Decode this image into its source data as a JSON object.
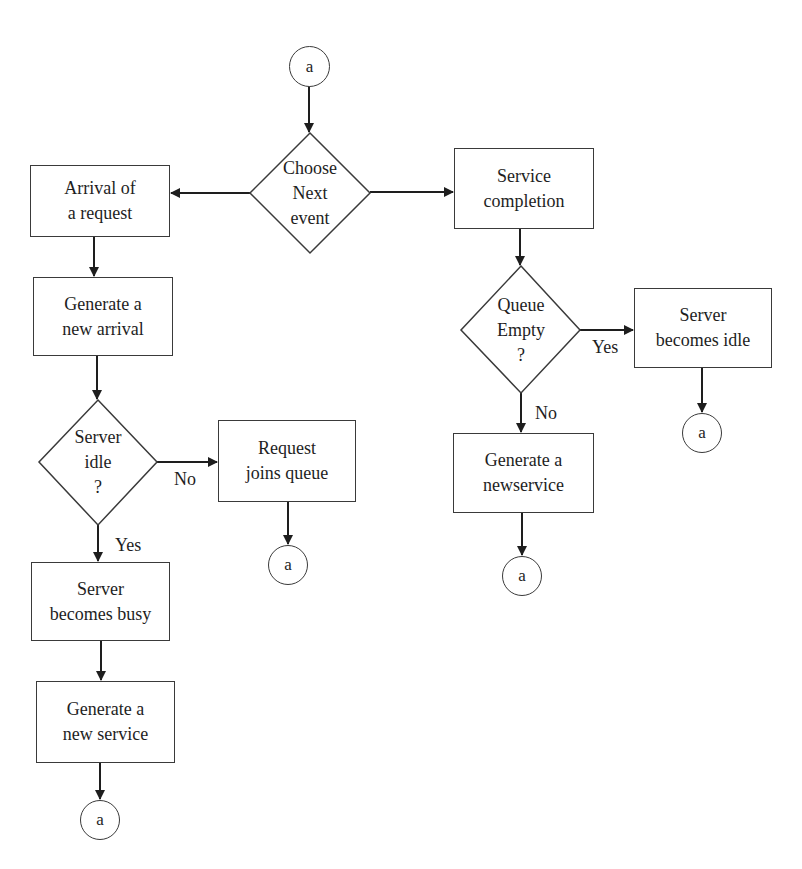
{
  "diagram": {
    "type": "flowchart",
    "colors": {
      "stroke": "#3a3a3a",
      "text": "#1e1e1e",
      "background": "#ffffff"
    },
    "connector_label": "a",
    "nodes": {
      "start": {
        "label": "a",
        "shape": "connector"
      },
      "choose_next_event": {
        "label": "Choose\nNext\nevent",
        "shape": "diamond"
      },
      "arrival_of_request": {
        "label": "Arrival of\na request",
        "shape": "box"
      },
      "generate_new_arrival": {
        "label": "Generate a\nnew arrival",
        "shape": "box"
      },
      "server_idle": {
        "label": "Server\nidle\n?",
        "shape": "diamond"
      },
      "request_joins_queue": {
        "label": "Request\njoins queue",
        "shape": "box"
      },
      "rjq_end": {
        "label": "a",
        "shape": "connector"
      },
      "server_becomes_busy": {
        "label": "Server\nbecomes busy",
        "shape": "box"
      },
      "generate_new_service_left": {
        "label": "Generate a\nnew service",
        "shape": "box"
      },
      "left_end": {
        "label": "a",
        "shape": "connector"
      },
      "service_completion": {
        "label": "Service\ncompletion",
        "shape": "box"
      },
      "queue_empty": {
        "label": "Queue\nEmpty\n?",
        "shape": "diamond"
      },
      "server_becomes_idle": {
        "label": "Server\nbecomes idle",
        "shape": "box"
      },
      "sbi_end": {
        "label": "a",
        "shape": "connector"
      },
      "generate_newservice_right": {
        "label": "Generate a\nnewservice",
        "shape": "box"
      },
      "right_end": {
        "label": "a",
        "shape": "connector"
      }
    },
    "edge_labels": {
      "server_idle_no": "No",
      "server_idle_yes": "Yes",
      "queue_empty_yes": "Yes",
      "queue_empty_no": "No"
    },
    "edges": [
      {
        "from": "start",
        "to": "choose_next_event"
      },
      {
        "from": "choose_next_event",
        "to": "arrival_of_request"
      },
      {
        "from": "choose_next_event",
        "to": "service_completion"
      },
      {
        "from": "arrival_of_request",
        "to": "generate_new_arrival"
      },
      {
        "from": "generate_new_arrival",
        "to": "server_idle"
      },
      {
        "from": "server_idle",
        "to": "request_joins_queue",
        "label": "No"
      },
      {
        "from": "request_joins_queue",
        "to": "rjq_end"
      },
      {
        "from": "server_idle",
        "to": "server_becomes_busy",
        "label": "Yes"
      },
      {
        "from": "server_becomes_busy",
        "to": "generate_new_service_left"
      },
      {
        "from": "generate_new_service_left",
        "to": "left_end"
      },
      {
        "from": "service_completion",
        "to": "queue_empty"
      },
      {
        "from": "queue_empty",
        "to": "server_becomes_idle",
        "label": "Yes"
      },
      {
        "from": "server_becomes_idle",
        "to": "sbi_end"
      },
      {
        "from": "queue_empty",
        "to": "generate_newservice_right",
        "label": "No"
      },
      {
        "from": "generate_newservice_right",
        "to": "right_end"
      }
    ]
  }
}
